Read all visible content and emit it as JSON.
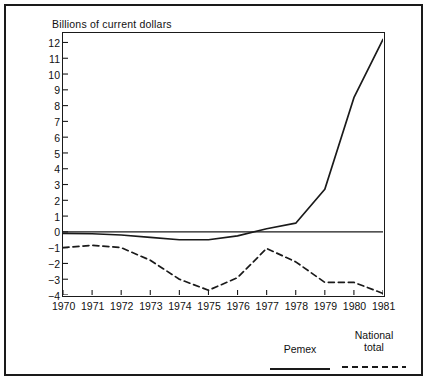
{
  "figure": {
    "title": "Billions of current dollars",
    "has_outer_border": true,
    "background_color": "#ffffff",
    "line_color": "#1a1a1a"
  },
  "legend": {
    "position": "bottom-right",
    "entries": [
      {
        "label": "Pemex",
        "label_line1": "Pemex",
        "label_line2": "",
        "style": "solid"
      },
      {
        "label": "National total",
        "label_line1": "National",
        "label_line2": "total",
        "style": "dashed"
      }
    ]
  },
  "chart_data": {
    "type": "line",
    "title": "Billions of current dollars",
    "subtitle": "",
    "xlabel": "",
    "ylabel": "",
    "x": [
      1970,
      1971,
      1972,
      1973,
      1974,
      1975,
      1976,
      1977,
      1978,
      1979,
      1980,
      1981
    ],
    "categories": [
      "1970",
      "1971",
      "1972",
      "1973",
      "1974",
      "1975",
      "1976",
      "1977",
      "1978",
      "1979",
      "1980",
      "1981"
    ],
    "xlim": [
      1970,
      1981
    ],
    "ylim": [
      -4,
      12.6
    ],
    "ytick_values": [
      12,
      11,
      10,
      9,
      8,
      7,
      6,
      5,
      4,
      3,
      2,
      1,
      0,
      -1,
      -2,
      -3,
      -4
    ],
    "ytick_labels": [
      "12",
      "11",
      "10",
      "9",
      "8",
      "7",
      "6",
      "5",
      "4",
      "3",
      "2",
      "1",
      "0",
      "−1",
      "−2",
      "−3",
      "−4"
    ],
    "xtick_labels": [
      "1970",
      "1971",
      "1972",
      "1973",
      "1974",
      "1975",
      "1976",
      "1977",
      "1978",
      "1979",
      "1980",
      "1981"
    ],
    "grid": false,
    "zero_line": true,
    "legend_position": "bottom-right",
    "series": [
      {
        "name": "Pemex",
        "style": "solid",
        "color": "#1a1a1a",
        "values": [
          -0.1,
          -0.12,
          -0.2,
          -0.35,
          -0.5,
          -0.5,
          -0.25,
          0.2,
          0.55,
          2.7,
          8.5,
          12.2
        ]
      },
      {
        "name": "National total",
        "style": "dashed",
        "color": "#1a1a1a",
        "values": [
          -1.0,
          -0.85,
          -1.0,
          -1.8,
          -3.0,
          -3.7,
          -2.9,
          -1.05,
          -1.9,
          -3.2,
          -3.2,
          -3.9
        ]
      }
    ]
  }
}
